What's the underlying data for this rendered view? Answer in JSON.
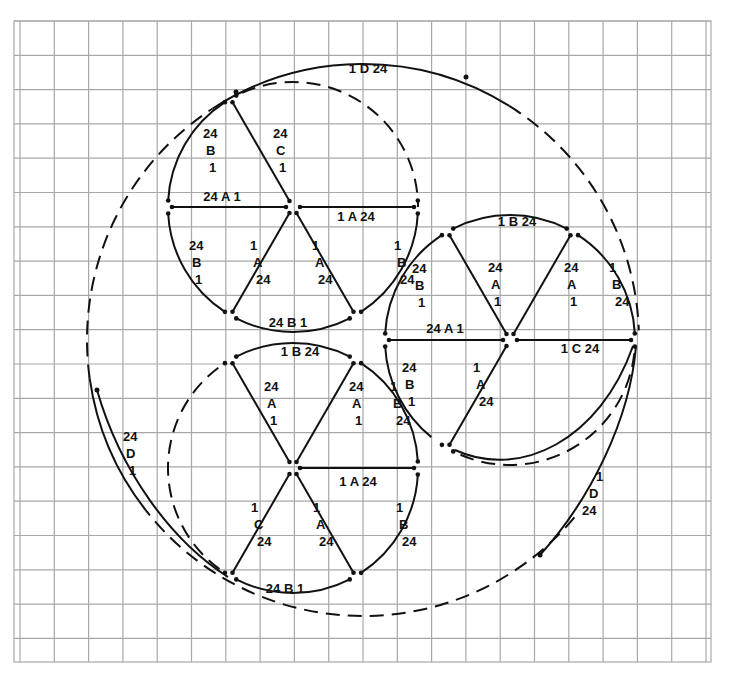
{
  "diagram": {
    "grid": {
      "x0": 20,
      "y0": 21,
      "x1": 705,
      "y1": 659,
      "step": 34.3,
      "outer_border": [
        14,
        21,
        711,
        662
      ]
    },
    "colors": {
      "grid": "#a8a8a8",
      "ink": "#111111",
      "paper": "#ffffff"
    },
    "circles": [
      {
        "id": "top",
        "cx": 293,
        "cy": 207,
        "r": 125
      },
      {
        "id": "bottom-left",
        "cx": 293,
        "cy": 468,
        "r": 125
      },
      {
        "id": "right",
        "cx": 510,
        "cy": 340,
        "r": 125
      },
      {
        "id": "outer",
        "cx": 363,
        "cy": 340,
        "r": 276
      }
    ],
    "labels": [
      {
        "circle": "outer",
        "text": [
          "1 D 24"
        ],
        "x": 368,
        "y": 73,
        "segment": "outer-top-D"
      },
      {
        "circle": "outer",
        "text": [
          "24",
          "D",
          "1"
        ],
        "x": 123,
        "y": 441,
        "segment": "outer-left-D"
      },
      {
        "circle": "outer",
        "text": [
          "1",
          "D",
          "24"
        ],
        "x": 582,
        "y": 481,
        "segment": "outer-right-D",
        "align": "diag"
      },
      {
        "circle": "top",
        "text": [
          "24",
          "B",
          "1"
        ],
        "x": 203,
        "y": 138,
        "segment": "top-arc-upper-left-B"
      },
      {
        "circle": "top",
        "text": [
          "24",
          "C",
          "1"
        ],
        "x": 273,
        "y": 138,
        "segment": "top-spoke-upper-C"
      },
      {
        "circle": "top",
        "text": [
          "24 A 1"
        ],
        "x": 222,
        "y": 201,
        "segment": "top-spoke-left-A"
      },
      {
        "circle": "top",
        "text": [
          "1 A 24"
        ],
        "x": 356,
        "y": 221,
        "segment": "top-spoke-right-A"
      },
      {
        "circle": "top",
        "text": [
          "24",
          "B",
          "1"
        ],
        "x": 189,
        "y": 250,
        "segment": "top-arc-lower-left-B"
      },
      {
        "circle": "top",
        "text": [
          "1",
          "A",
          "24"
        ],
        "x": 250,
        "y": 250,
        "segment": "top-spoke-lower-left-A"
      },
      {
        "circle": "top",
        "text": [
          "1",
          "A",
          "24"
        ],
        "x": 312,
        "y": 250,
        "segment": "top-spoke-lower-right-A"
      },
      {
        "circle": "top",
        "text": [
          "1",
          "B",
          "24"
        ],
        "x": 394,
        "y": 250,
        "segment": "top-arc-lower-right-B"
      },
      {
        "circle": "top",
        "text": [
          "24 B 1"
        ],
        "x": 288,
        "y": 327,
        "segment": "top-arc-bottom-B"
      },
      {
        "circle": "right",
        "text": [
          "1 B 24"
        ],
        "x": 517,
        "y": 226,
        "segment": "right-arc-top-B"
      },
      {
        "circle": "right",
        "text": [
          "24",
          "B",
          "1"
        ],
        "x": 412,
        "y": 273,
        "segment": "right-arc-upper-left-B"
      },
      {
        "circle": "right",
        "text": [
          "24",
          "A",
          "1"
        ],
        "x": 488,
        "y": 272,
        "segment": "right-spoke-upper-left-A"
      },
      {
        "circle": "right",
        "text": [
          "24",
          "A",
          "1"
        ],
        "x": 564,
        "y": 272,
        "segment": "right-spoke-upper-right-A"
      },
      {
        "circle": "right",
        "text": [
          "1",
          "B",
          "24"
        ],
        "x": 609,
        "y": 272,
        "segment": "right-arc-upper-right-B"
      },
      {
        "circle": "right",
        "text": [
          "24 A 1"
        ],
        "x": 445,
        "y": 333,
        "segment": "right-spoke-left-A"
      },
      {
        "circle": "right",
        "text": [
          "1 C 24"
        ],
        "x": 580,
        "y": 353,
        "segment": "right-spoke-right-C"
      },
      {
        "circle": "right",
        "text": [
          "24",
          "B",
          "1"
        ],
        "x": 402,
        "y": 372,
        "segment": "right-arc-lower-left-B"
      },
      {
        "circle": "right",
        "text": [
          "1",
          "A",
          "24"
        ],
        "x": 473,
        "y": 372,
        "segment": "right-spoke-lower-left-A"
      },
      {
        "circle": "bottom-left",
        "text": [
          "1 B 24"
        ],
        "x": 300,
        "y": 356,
        "segment": "bl-arc-top-B"
      },
      {
        "circle": "bottom-left",
        "text": [
          "24",
          "A",
          "1"
        ],
        "x": 264,
        "y": 391,
        "segment": "bl-spoke-upper-left-A"
      },
      {
        "circle": "bottom-left",
        "text": [
          "24",
          "A",
          "1"
        ],
        "x": 349,
        "y": 391,
        "segment": "bl-spoke-upper-right-A"
      },
      {
        "circle": "bottom-left",
        "text": [
          "1",
          "B",
          "24"
        ],
        "x": 390,
        "y": 391,
        "segment": "bl-arc-upper-right-B"
      },
      {
        "circle": "bottom-left",
        "text": [
          "1 A 24"
        ],
        "x": 358,
        "y": 486,
        "segment": "bl-spoke-right-A"
      },
      {
        "circle": "bottom-left",
        "text": [
          "1",
          "C",
          "24"
        ],
        "x": 251,
        "y": 512,
        "segment": "bl-spoke-lower-left-C"
      },
      {
        "circle": "bottom-left",
        "text": [
          "1",
          "A",
          "24"
        ],
        "x": 313,
        "y": 512,
        "segment": "bl-spoke-lower-right-A"
      },
      {
        "circle": "bottom-left",
        "text": [
          "1",
          "B",
          "24"
        ],
        "x": 396,
        "y": 512,
        "segment": "bl-arc-lower-right-B"
      },
      {
        "circle": "bottom-left",
        "text": [
          "24 B 1"
        ],
        "x": 285,
        "y": 593,
        "segment": "bl-arc-bottom-B"
      }
    ]
  }
}
